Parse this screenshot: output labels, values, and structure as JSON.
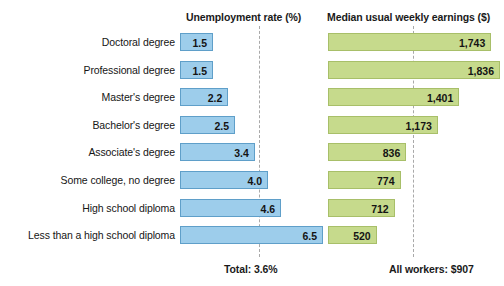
{
  "chart_data": {
    "type": "bar",
    "title": "",
    "orientation": "horizontal",
    "grid": false,
    "legend": null,
    "categories": [
      "Doctoral degree",
      "Professional degree",
      "Master's degree",
      "Bachelor's degree",
      "Associate's degree",
      "Some college, no degree",
      "High school diploma",
      "Less than a high school diploma"
    ],
    "panels": [
      {
        "key": "unemployment",
        "header": "Unemployment rate (%)",
        "xlabel": "",
        "ylabel": "",
        "xlim": [
          0,
          7
        ],
        "values": [
          1.5,
          1.5,
          2.2,
          2.5,
          3.4,
          4.0,
          4.6,
          6.5
        ],
        "value_labels": [
          "1.5",
          "1.5",
          "2.2",
          "2.5",
          "3.4",
          "4.0",
          "4.6",
          "6.5"
        ],
        "reference_value": 3.6,
        "footer": "Total: 3.6%",
        "color": "#9dcdeb",
        "border_color": "#5f9fc9"
      },
      {
        "key": "earnings",
        "header": "Median usual weekly earnings ($)",
        "xlabel": "",
        "ylabel": "",
        "xlim": [
          0,
          1900
        ],
        "values": [
          1743,
          1836,
          1401,
          1173,
          836,
          774,
          712,
          520
        ],
        "value_labels": [
          "1,743",
          "1,836",
          "1,401",
          "1,173",
          "836",
          "774",
          "712",
          "520"
        ],
        "reference_value": 907,
        "footer": "All workers: $907",
        "color": "#c6da8c",
        "border_color": "#a8bf69"
      }
    ]
  },
  "headers": {
    "unemployment": "Unemployment rate (%)",
    "earnings": "Median usual weekly earnings ($)"
  },
  "footers": {
    "total": "Total: 3.6%",
    "all_workers": "All workers: $907"
  },
  "categories": {
    "0": "Doctoral degree",
    "1": "Professional degree",
    "2": "Master's degree",
    "3": "Bachelor's degree",
    "4": "Associate's degree",
    "5": "Some college, no degree",
    "6": "High school diploma",
    "7": "Less than a high school diploma"
  }
}
